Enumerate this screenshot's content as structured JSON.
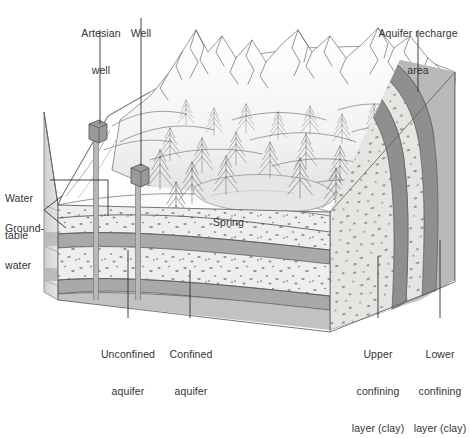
{
  "figure": {
    "type": "geological-block-diagram",
    "palette": {
      "ink": "#3a3a3a",
      "label_text": "#333333",
      "leader_line": "#2f2f2f",
      "aquifer_fill": "#efeeec",
      "aquifer_speckle": "#8d8d8d",
      "clay_fill": "#a9a9a9",
      "clay_fill_dark": "#8f8f8f",
      "bedrock_fill": "#b9b9b9",
      "side_face": "#d8d8d6",
      "surface_fill": "#ffffff",
      "mountain_shade": "#d9d9d9",
      "water_fill": "#e6e6e6",
      "well_fill": "#9a9a9a",
      "background": "#ffffff"
    }
  },
  "labels": {
    "artesian_well": {
      "line1": "Artesian",
      "line2": "well"
    },
    "well": {
      "line1": "Well"
    },
    "aquifer_recharge": {
      "line1": "Aquifer recharge",
      "line2": "area"
    },
    "water_table": {
      "line1": "Water",
      "line2": "table"
    },
    "groundwater": {
      "line1": "Ground-",
      "line2": "water"
    },
    "spring": {
      "line1": "Spring"
    },
    "unconfined_aquifer": {
      "line1": "Unconfined",
      "line2": "aquifer"
    },
    "confined_aquifer": {
      "line1": "Confined",
      "line2": "aquifer"
    },
    "upper_confining": {
      "line1": "Upper",
      "line2": "confining",
      "line3": "layer (clay)"
    },
    "lower_confining": {
      "line1": "Lower",
      "line2": "confining",
      "line3": "layer (clay)"
    }
  },
  "strata": [
    {
      "name": "unconfined-aquifer",
      "kind": "aquifer",
      "note": "stippled sand and gravel above water table top portion"
    },
    {
      "name": "upper-confining-layer",
      "kind": "clay",
      "note": "dark gray impermeable clay"
    },
    {
      "name": "confined-aquifer",
      "kind": "aquifer",
      "note": "stippled sand and gravel between clay layers"
    },
    {
      "name": "lower-confining-layer",
      "kind": "clay",
      "note": "dark gray impermeable clay"
    },
    {
      "name": "bedrock",
      "kind": "bedrock",
      "note": "gray basal rock"
    }
  ],
  "features": [
    {
      "name": "artesian-well",
      "kind": "wellhead"
    },
    {
      "name": "well",
      "kind": "wellhead"
    },
    {
      "name": "spring-pond",
      "kind": "surface-water"
    },
    {
      "name": "mountain-range",
      "kind": "terrain"
    },
    {
      "name": "conifer-forest",
      "kind": "vegetation"
    }
  ]
}
